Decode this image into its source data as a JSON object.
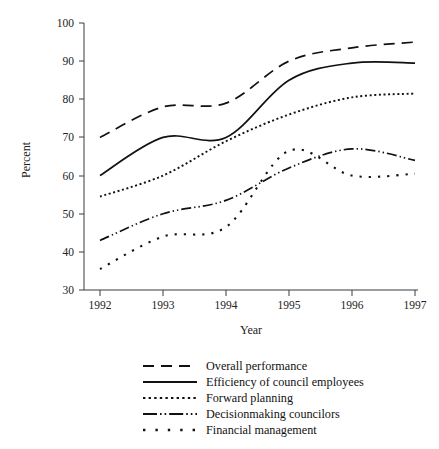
{
  "chart_data": {
    "type": "line",
    "title": "",
    "xlabel": "Year",
    "ylabel": "Percent",
    "x": [
      1992,
      1993,
      1994,
      1995,
      1996,
      1997
    ],
    "categories": [
      "1992",
      "1993",
      "1994",
      "1995",
      "1996",
      "1997"
    ],
    "xlim": [
      1992,
      1997
    ],
    "ylim": [
      30,
      100
    ],
    "yticks": [
      30,
      40,
      50,
      60,
      70,
      80,
      90,
      100
    ],
    "xticks": [
      "1992",
      "1993",
      "1994",
      "1995",
      "1996",
      "1997"
    ],
    "grid": false,
    "legend_position": "bottom-center",
    "series": [
      {
        "name": "Overall performance",
        "style": "long-dash",
        "values": [
          70,
          78,
          79,
          90,
          93.5,
          95
        ]
      },
      {
        "name": "Efficiency of council employees",
        "style": "solid",
        "values": [
          60,
          70,
          70,
          85,
          89.5,
          89.5
        ]
      },
      {
        "name": "Forward planning",
        "style": "dotted-fine",
        "values": [
          54.5,
          60,
          69,
          76,
          80.5,
          81.5
        ]
      },
      {
        "name": "Decisionmaking councilors",
        "style": "dash-dot-dot",
        "values": [
          43,
          50,
          53.5,
          62,
          67,
          64
        ]
      },
      {
        "name": "Financial management",
        "style": "dotted-wide",
        "values": [
          35.5,
          44,
          46.5,
          66.5,
          60,
          60.5
        ]
      }
    ]
  },
  "axis": {
    "y_title": "Percent",
    "x_title": "Year",
    "y_tick_labels": [
      "100",
      "90",
      "80",
      "70",
      "60",
      "50",
      "40",
      "30"
    ],
    "x_tick_labels": [
      "1992",
      "1993",
      "1994",
      "1995",
      "1996",
      "1997"
    ]
  },
  "legend": {
    "items": [
      {
        "label": "Overall performance",
        "style": "long-dash"
      },
      {
        "label": "Efficiency of council employees",
        "style": "solid"
      },
      {
        "label": "Forward planning",
        "style": "dotted-fine"
      },
      {
        "label": "Decisionmaking councilors",
        "style": "dash-dot-dot"
      },
      {
        "label": "Financial management",
        "style": "dotted-wide"
      }
    ]
  }
}
